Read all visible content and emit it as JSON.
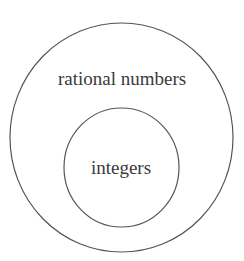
{
  "diagram": {
    "type": "venn-nested",
    "outer_set": {
      "label": "rational numbers"
    },
    "inner_set": {
      "label": "integers"
    },
    "stroke_color": "#555555",
    "text_color": "#3a3a3a"
  }
}
